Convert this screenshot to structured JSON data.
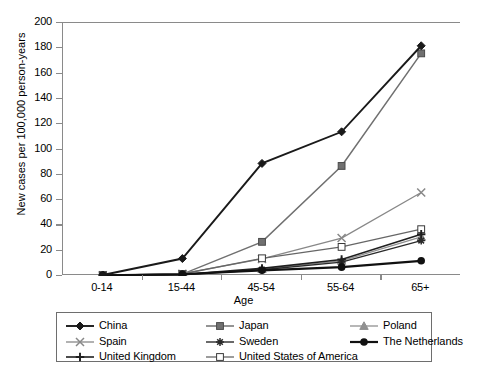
{
  "chart_data": {
    "type": "line",
    "title": "",
    "xlabel": "Age",
    "ylabel": "New cases per 100,000 person-years",
    "categories": [
      "0-14",
      "15-44",
      "45-54",
      "55-64",
      "65+"
    ],
    "ylim": [
      0,
      200
    ],
    "yticks": [
      0,
      20,
      40,
      60,
      80,
      100,
      120,
      140,
      160,
      180,
      200
    ],
    "grid": false,
    "legend_position": "bottom",
    "series": [
      {
        "name": "China",
        "marker": "filled-diamond",
        "color": "#1a1a1a",
        "line_width": 1.9,
        "values": [
          0.8,
          13.8,
          89.0,
          114.0,
          182.0
        ]
      },
      {
        "name": "Japan",
        "marker": "filled-square",
        "color": "#707070",
        "line_width": 1.5,
        "values": [
          0.5,
          1.5,
          27.0,
          87.0,
          176.0
        ]
      },
      {
        "name": "Poland",
        "marker": "filled-triangle",
        "color": "#909090",
        "line_width": 1.3,
        "values": [
          0.4,
          1.2,
          5.5,
          12.0,
          31.0
        ]
      },
      {
        "name": "Spain",
        "marker": "cross-x",
        "color": "#888888",
        "line_width": 1.3,
        "values": [
          0.5,
          1.8,
          13.5,
          30.0,
          66.0
        ]
      },
      {
        "name": "Sweden",
        "marker": "asterisk",
        "color": "#2a2a2a",
        "line_width": 1.4,
        "values": [
          0.3,
          1.0,
          5.0,
          11.0,
          28.0
        ]
      },
      {
        "name": "The Netherlands",
        "marker": "filled-circle",
        "color": "#111111",
        "line_width": 2.2,
        "values": [
          0.6,
          1.4,
          4.5,
          7.0,
          12.0
        ]
      },
      {
        "name": "United Kingdom",
        "marker": "plus",
        "color": "#1f1f1f",
        "line_width": 1.6,
        "values": [
          0.4,
          1.1,
          6.0,
          13.0,
          33.0
        ]
      },
      {
        "name": "United States of America",
        "marker": "open-square",
        "color": "#666666",
        "line_width": 1.3,
        "values": [
          0.7,
          1.6,
          14.0,
          23.0,
          37.0
        ]
      }
    ]
  },
  "legend": {
    "entries": [
      {
        "label": "China",
        "marker": "filled-diamond"
      },
      {
        "label": "Japan",
        "marker": "filled-square"
      },
      {
        "label": "Poland",
        "marker": "filled-triangle"
      },
      {
        "label": "Spain",
        "marker": "cross-x"
      },
      {
        "label": "Sweden",
        "marker": "asterisk"
      },
      {
        "label": "The Netherlands",
        "marker": "filled-circle"
      },
      {
        "label": "United Kingdom",
        "marker": "plus"
      },
      {
        "label": "United States of America",
        "marker": "open-square"
      }
    ]
  }
}
